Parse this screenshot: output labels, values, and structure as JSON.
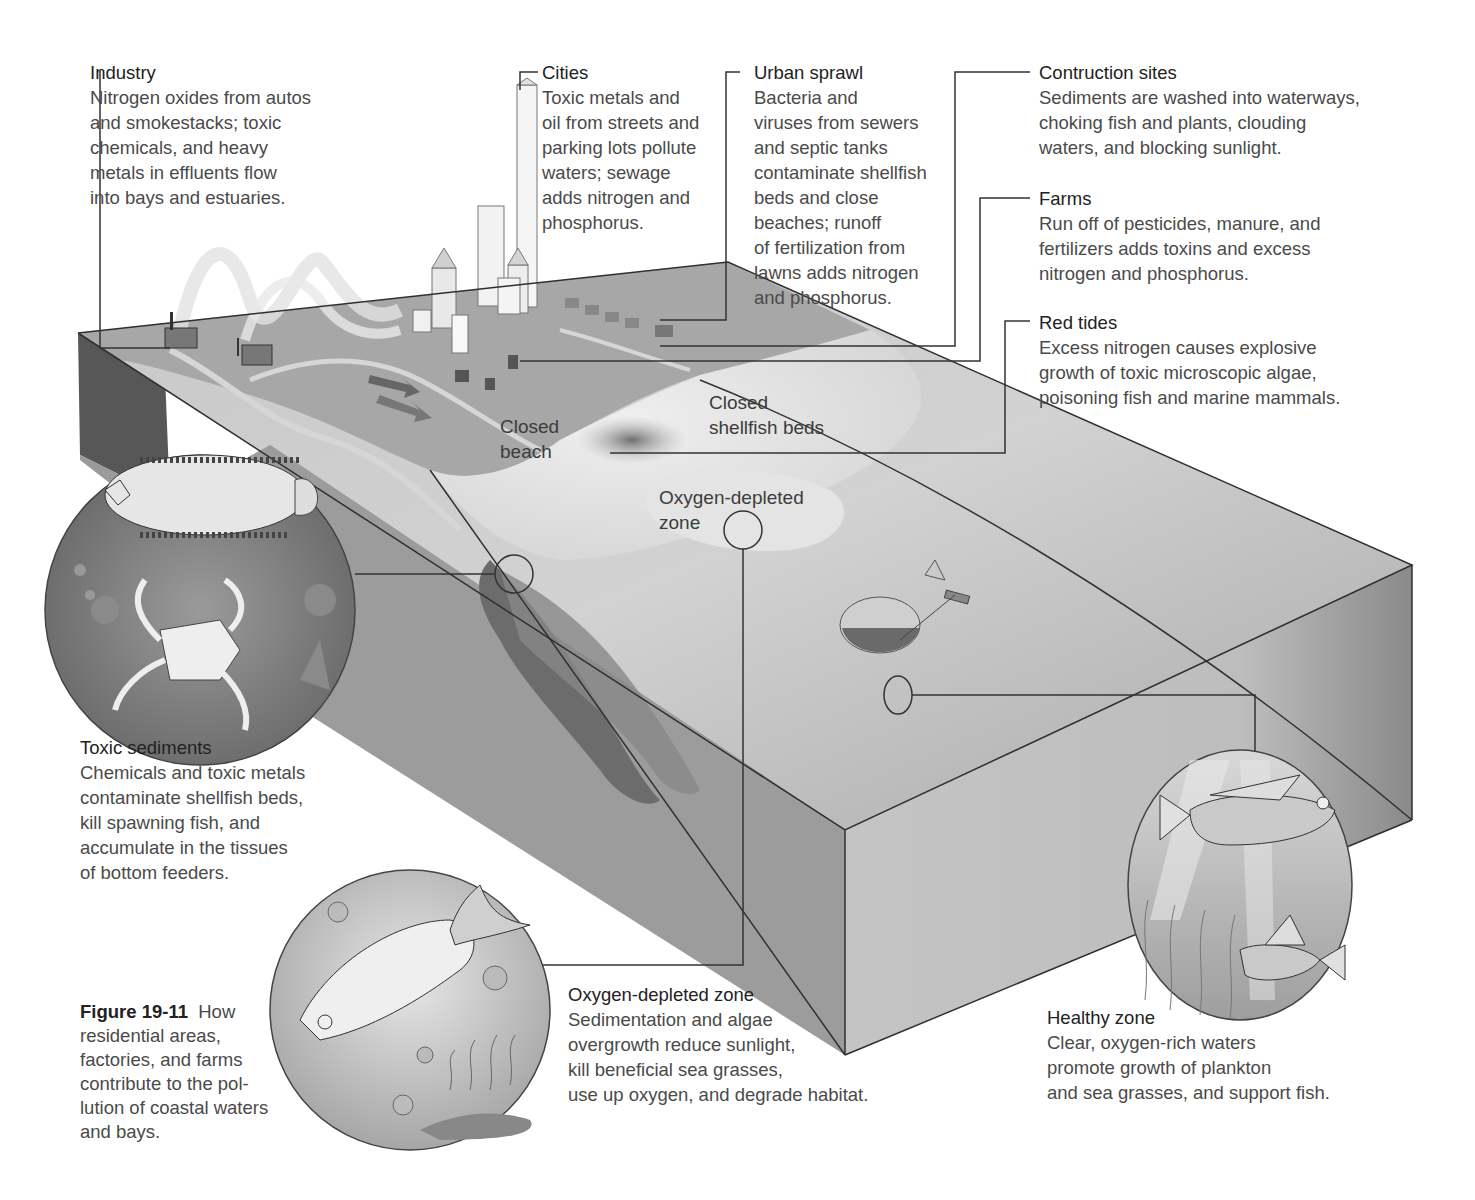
{
  "figure": {
    "number": "Figure 19-11",
    "caption_lines": [
      "How",
      "residential areas,",
      "factories, and farms",
      "contribute to the pol-",
      "lution of coastal waters",
      "and bays."
    ]
  },
  "callouts": {
    "industry": {
      "title": "Industry",
      "lines": [
        "Nitrogen oxides from autos",
        "and smokestacks; toxic",
        "chemicals, and heavy",
        "metals in effluents flow",
        "into bays and estuaries."
      ]
    },
    "cities": {
      "title": "Cities",
      "lines": [
        "Toxic metals and",
        "oil from streets and",
        "parking lots pollute",
        "waters; sewage",
        "adds nitrogen and",
        "phosphorus."
      ]
    },
    "urban_sprawl": {
      "title": "Urban sprawl",
      "lines": [
        "Bacteria and",
        "viruses from sewers",
        "and septic tanks",
        "contaminate shellfish",
        "beds and close",
        "beaches; runoff",
        "of fertilization from",
        "lawns adds nitrogen",
        "and phosphorus."
      ]
    },
    "construction_sites": {
      "title": "Contruction sites",
      "lines": [
        "Sediments are washed into waterways,",
        "choking fish and plants, clouding",
        "waters, and blocking sunlight."
      ]
    },
    "farms": {
      "title": "Farms",
      "lines": [
        "Run off of pesticides, manure, and",
        "fertilizers adds toxins and excess",
        "nitrogen and phosphorus."
      ]
    },
    "red_tides": {
      "title": "Red tides",
      "lines": [
        "Excess nitrogen causes explosive",
        "growth of toxic microscopic algae,",
        "poisoning fish and marine mammals."
      ]
    },
    "toxic_sediments": {
      "title": "Toxic sediments",
      "lines": [
        "Chemicals and toxic metals",
        "contaminate shellfish beds,",
        "kill spawning fish, and",
        "accumulate in the tissues",
        "of bottom feeders."
      ]
    },
    "oxygen_depleted_zone": {
      "title": "Oxygen-depleted zone",
      "lines": [
        "Sedimentation and algae",
        "overgrowth reduce sunlight,",
        "kill beneficial sea grasses,",
        "use up oxygen, and degrade habitat."
      ]
    },
    "healthy_zone": {
      "title": "Healthy zone",
      "lines": [
        "Clear, oxygen-rich waters",
        "promote growth of plankton",
        "and sea grasses, and support fish."
      ]
    }
  },
  "map_labels": {
    "closed_beach": [
      "Closed",
      "beach"
    ],
    "closed_shellfish_beds": [
      "Closed",
      "shellfish beds"
    ],
    "oxygen_depleted_zone": [
      "Oxygen-depleted",
      "zone"
    ]
  },
  "colors": {
    "background": "#ffffff",
    "land": "#a9a9a9",
    "shallow_water": "#dcdcdc",
    "deep_water": "#9a9a9a",
    "block_front": "#8c8c8c",
    "block_side_dark": "#555555",
    "leader_line": "#333333",
    "text": "#4a4a4a"
  }
}
